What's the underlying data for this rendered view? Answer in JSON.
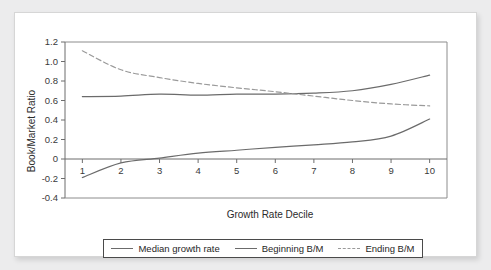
{
  "chart_data": {
    "type": "line",
    "title": "",
    "xlabel": "Growth Rate Decile",
    "ylabel": "Book/Market Ratio",
    "categories": [
      "1",
      "2",
      "3",
      "4",
      "5",
      "6",
      "7",
      "8",
      "9",
      "10"
    ],
    "x": [
      1,
      2,
      3,
      4,
      5,
      6,
      7,
      8,
      9,
      10
    ],
    "xlim": [
      0.55,
      10.45
    ],
    "ylim": [
      -0.4,
      1.2
    ],
    "yticks": [
      "1.2",
      "1.0",
      "0.8",
      "0.6",
      "0.4",
      "0.2",
      "0",
      "-0.2",
      "-0.4"
    ],
    "ytick_values": [
      1.2,
      1.0,
      0.8,
      0.6,
      0.4,
      0.2,
      0,
      -0.2,
      -0.4
    ],
    "grid": false,
    "legend_position": "bottom",
    "series": [
      {
        "name": "Median growth rate",
        "style": "solid",
        "color": "#6b6b6b",
        "values": [
          -0.19,
          -0.04,
          0.01,
          0.06,
          0.09,
          0.12,
          0.145,
          0.175,
          0.235,
          0.41
        ]
      },
      {
        "name": "Beginning B/M",
        "style": "solid",
        "color": "#6b6b6b",
        "values": [
          0.64,
          0.645,
          0.665,
          0.655,
          0.665,
          0.665,
          0.675,
          0.7,
          0.765,
          0.86
        ]
      },
      {
        "name": "Ending B/M",
        "style": "dashed",
        "color": "#9a9a9a",
        "values": [
          1.11,
          0.915,
          0.835,
          0.775,
          0.73,
          0.69,
          0.645,
          0.6,
          0.565,
          0.545
        ]
      }
    ]
  },
  "legend": {
    "entries": [
      {
        "label": "Median growth rate",
        "style": "solid"
      },
      {
        "label": "Beginning B/M",
        "style": "solid"
      },
      {
        "label": "Ending B/M",
        "style": "dashed"
      }
    ]
  },
  "axes": {
    "x_title": "Growth Rate Decile",
    "y_title": "Book/Market Ratio",
    "x_tick_labels": [
      "1",
      "2",
      "3",
      "4",
      "5",
      "6",
      "7",
      "8",
      "9",
      "10"
    ],
    "y_tick_labels": [
      "1.2",
      "1.0",
      "0.8",
      "0.6",
      "0.4",
      "0.2",
      "0",
      "-0.2",
      "-0.4"
    ]
  }
}
